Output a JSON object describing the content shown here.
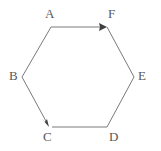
{
  "figure": {
    "type": "hexagon-with-arrows",
    "background_color": "#ffffff",
    "stroke_color": "#7a7a7c",
    "arrow_color": "#4a4a4c",
    "label_color": "#58585a",
    "stroke_width": 1,
    "vertices": [
      {
        "id": "A",
        "label": "A",
        "x": 51,
        "y": 27
      },
      {
        "id": "F",
        "label": "F",
        "x": 107,
        "y": 27
      },
      {
        "id": "E",
        "label": "E",
        "x": 134,
        "y": 77
      },
      {
        "id": "D",
        "label": "D",
        "x": 107,
        "y": 127
      },
      {
        "id": "C",
        "label": "C",
        "x": 49,
        "y": 127
      },
      {
        "id": "B",
        "label": "B",
        "x": 22,
        "y": 77
      }
    ],
    "edges": [
      {
        "from": "A",
        "to": "F",
        "arrow": true,
        "direction": "A-to-F"
      },
      {
        "from": "F",
        "to": "E",
        "arrow": false,
        "direction": "none"
      },
      {
        "from": "E",
        "to": "D",
        "arrow": false,
        "direction": "none"
      },
      {
        "from": "D",
        "to": "C",
        "arrow": false,
        "direction": "none"
      },
      {
        "from": "C",
        "to": "B",
        "arrow": true,
        "direction": "B-to-C"
      },
      {
        "from": "B",
        "to": "A",
        "arrow": false,
        "direction": "none"
      }
    ],
    "arrows": [
      {
        "id": "arrow-a-f",
        "from": "A",
        "to": "F",
        "tip_x": 107,
        "tip_y": 27
      },
      {
        "id": "arrow-b-c",
        "from": "B",
        "to": "C",
        "tip_x": 49,
        "tip_y": 127
      }
    ]
  }
}
